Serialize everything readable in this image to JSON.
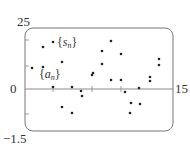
{
  "chart_data": {
    "type": "scatter",
    "title": "",
    "xlabel": "",
    "ylabel": "",
    "xlim": [
      0,
      15
    ],
    "ylim": [
      -1.5,
      25
    ],
    "grid": false,
    "legend_position": "inline annotations",
    "tick_labels": {
      "y_top": "25",
      "y_zero": "0",
      "y_bottom": "−1.5",
      "x_right": "15"
    },
    "annotations": [
      {
        "id": "s",
        "open": "{",
        "var": "s",
        "sub": "n",
        "close": "}",
        "x": 3.1,
        "y": 21.1
      },
      {
        "id": "a",
        "open": "{",
        "var": "a",
        "sub": "n",
        "close": "}",
        "x": 1.1,
        "y": 11.2
      }
    ],
    "points_px": [
      {
        "x": 43,
        "y": 47
      },
      {
        "x": 53,
        "y": 42
      },
      {
        "x": 32,
        "y": 68
      },
      {
        "x": 43,
        "y": 67
      },
      {
        "x": 62,
        "y": 62
      },
      {
        "x": 53,
        "y": 87
      },
      {
        "x": 72,
        "y": 87
      },
      {
        "x": 62,
        "y": 107
      },
      {
        "x": 72,
        "y": 113
      },
      {
        "x": 81,
        "y": 91
      },
      {
        "x": 82,
        "y": 96
      },
      {
        "x": 92,
        "y": 75
      },
      {
        "x": 93,
        "y": 73
      },
      {
        "x": 111,
        "y": 41
      },
      {
        "x": 102,
        "y": 51
      },
      {
        "x": 121,
        "y": 54
      },
      {
        "x": 102,
        "y": 64
      },
      {
        "x": 121,
        "y": 80
      },
      {
        "x": 111,
        "y": 80
      },
      {
        "x": 125,
        "y": 92
      },
      {
        "x": 131,
        "y": 103
      },
      {
        "x": 139,
        "y": 88
      },
      {
        "x": 140,
        "y": 104
      },
      {
        "x": 130,
        "y": 113
      },
      {
        "x": 150,
        "y": 77
      },
      {
        "x": 150,
        "y": 81
      },
      {
        "x": 159,
        "y": 59
      },
      {
        "x": 159,
        "y": 65
      }
    ],
    "series": [
      {
        "name": "{s_n}",
        "x": [
          2,
          3,
          5,
          6,
          7,
          8,
          10,
          11,
          12,
          13,
          14
        ],
        "y": [
          21.5,
          23.4,
          17.8,
          18.3,
          23.9,
          17.6,
          21.3,
          17.6,
          11.2,
          17.1,
          14.1
        ]
      },
      {
        "name": "{a_n}",
        "x": [
          1,
          2,
          3,
          4,
          5,
          6,
          7,
          8,
          9,
          10,
          11,
          12,
          13,
          14,
          15
        ],
        "y": [
          13.4,
          13.8,
          11.2,
          8.6,
          0.8,
          -0.5,
          -0.1,
          11.9,
          -4.8,
          5.5,
          10.0,
          -1.0,
          5.2,
          5.7,
          13.2
        ]
      }
    ]
  },
  "labels": {
    "y_top": "25",
    "y_zero": "0",
    "y_bottom": "−1.5",
    "x_right": "15",
    "s_open": "{",
    "s_var": "s",
    "s_sub": "n",
    "s_close": "}",
    "a_open": "{",
    "a_var": "a",
    "a_sub": "n",
    "a_close": "}"
  },
  "colors": {
    "frame": "#777777",
    "axis": "#888888",
    "points": "#222222",
    "text": "#333333",
    "background": "#ffffff"
  }
}
